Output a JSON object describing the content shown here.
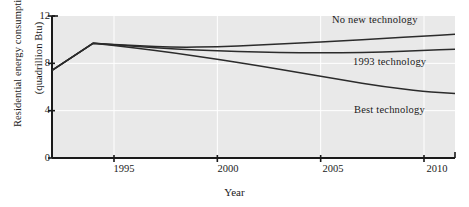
{
  "chart_data": {
    "type": "line",
    "title": "",
    "xlabel": "Year",
    "ylabel": "Residential energy consumption (quadrillion Btu)",
    "ylabel_line1": "Residential energy consumption",
    "ylabel_line2": "(quadrillion Btu)",
    "xlim": [
      1992.0,
      1992.0
    ],
    "ylim": [
      0,
      12
    ],
    "xticks": [
      1995,
      2000,
      2005,
      2010
    ],
    "xtick_labels": [
      "1995",
      "2000",
      "2005",
      "2010"
    ],
    "yticks": [
      0,
      4,
      8,
      12
    ],
    "ytick_labels": [
      "0",
      "4",
      "8",
      "12"
    ],
    "grid": true,
    "grid_color": "#ffffff",
    "legend_position": "inline-annotations",
    "plot_background": "#e9e9e9",
    "line_color": "#2b2b2b",
    "x": [
      1992.0,
      1994.0,
      1996.0,
      1998.0,
      2000.0,
      2002.0,
      2004.0,
      2006.0,
      2008.0,
      2010.0,
      2011.5
    ],
    "series": [
      {
        "name": "No new technology",
        "label": "No new technology",
        "label_x": 332,
        "label_y": 14,
        "values": [
          7.4,
          9.7,
          9.5,
          9.35,
          9.4,
          9.55,
          9.7,
          9.9,
          10.1,
          10.3,
          10.45
        ]
      },
      {
        "name": "1993 technology",
        "label": "1993 technology",
        "label_x": 353,
        "label_y": 56,
        "values": [
          7.4,
          9.7,
          9.45,
          9.2,
          9.05,
          8.95,
          8.9,
          8.9,
          8.95,
          9.1,
          9.2
        ]
      },
      {
        "name": "Best technology",
        "label": "Best technology",
        "label_x": 354,
        "label_y": 104,
        "values": [
          7.4,
          9.7,
          9.3,
          8.85,
          8.35,
          7.8,
          7.2,
          6.6,
          6.05,
          5.6,
          5.45
        ]
      }
    ]
  }
}
